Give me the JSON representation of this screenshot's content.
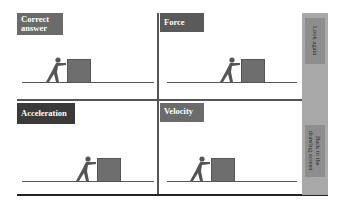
{
  "panels": [
    {
      "id": "correct-answer",
      "label": "Correct answer",
      "label_color": "#6b6b6b"
    },
    {
      "id": "force",
      "label": "Force",
      "label_color": "#5a5a5a"
    },
    {
      "id": "acceleration",
      "label": "Acceleration",
      "label_color": "#3a3a3a"
    },
    {
      "id": "velocity",
      "label": "Velocity",
      "label_color": "#6b6b6b"
    }
  ],
  "sidebar": {
    "look_again": "Look again",
    "back": "Back to the drawing screen"
  }
}
